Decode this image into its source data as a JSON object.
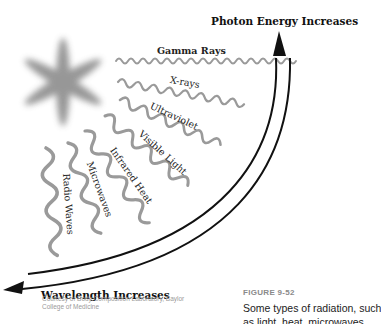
{
  "figure": {
    "title_top": "Photon Energy Increases",
    "title_bottom": "Wavelength Increases",
    "waves": [
      {
        "label": "Gamma Rays"
      },
      {
        "label": "X-rays"
      },
      {
        "label": "Ultraviolet"
      },
      {
        "label": "Visible Light"
      },
      {
        "label": "Infrared Heat"
      },
      {
        "label": "Microwaves"
      },
      {
        "label": "Radio Waves"
      }
    ],
    "source_icon": "star-burst-icon",
    "credit": "Courtesy of Body Composition Laboratory, Baylor College of Medicine",
    "figure_number": "FIGURE 9-52",
    "caption_line1": "Some types of radiation, such",
    "caption_line2": "as light, heat, microwaves,"
  },
  "colors": {
    "wave": "#9a9a9a",
    "arc": "#111111",
    "star": "#8c8c8c",
    "figure_number": "#8a8a8a",
    "credit": "#9a9a9a"
  }
}
